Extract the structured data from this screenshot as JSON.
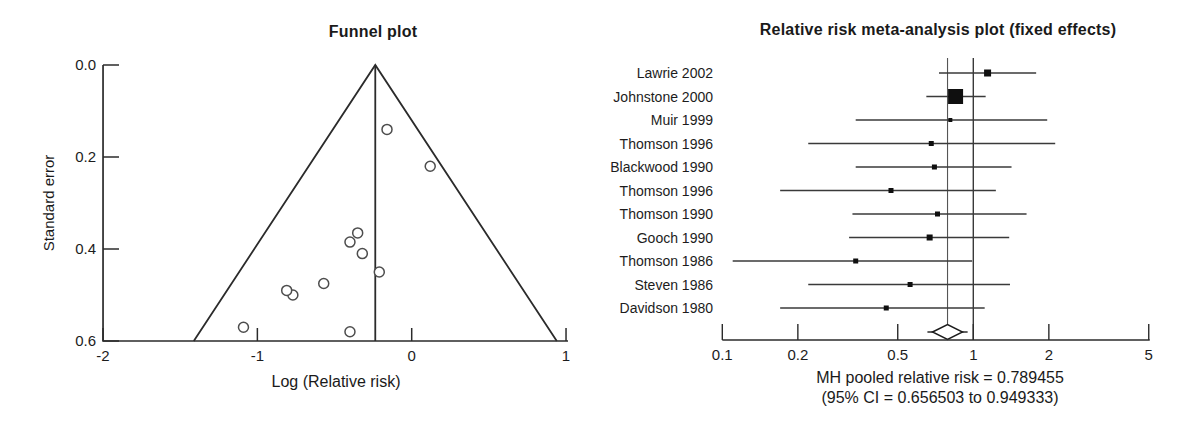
{
  "page": {
    "background": "#ffffff",
    "ink_color": "#2b2b2b"
  },
  "chart_data": [
    {
      "id": "funnel-plot",
      "type": "scatter",
      "title": "Funnel plot",
      "xlabel": "Log (Relative risk)",
      "ylabel": "Standard error",
      "xlim": [
        -2,
        1
      ],
      "ylim": [
        0,
        0.6
      ],
      "y_axis_inverted": true,
      "grid": false,
      "x_ticks": [
        {
          "value": -2,
          "label": "-2"
        },
        {
          "value": -1,
          "label": "-1"
        },
        {
          "value": 0,
          "label": "0"
        },
        {
          "value": 1,
          "label": "1"
        }
      ],
      "y_ticks": [
        {
          "value": 0,
          "label": "0.0"
        },
        {
          "value": 0.2,
          "label": "0.2"
        },
        {
          "value": 0.4,
          "label": "0.4"
        },
        {
          "value": 0.6,
          "label": "0.6"
        }
      ],
      "center_line_x": -0.236,
      "funnel_outline": {
        "apex": [
          -0.236,
          0
        ],
        "base_left": [
          -1.412,
          0.6
        ],
        "base_right": [
          0.94,
          0.6
        ]
      },
      "points": [
        {
          "study": "Lawrie 2002",
          "x": 0.12,
          "y": 0.22
        },
        {
          "study": "Johnstone 2000",
          "x": -0.16,
          "y": 0.14
        },
        {
          "study": "Muir 1999",
          "x": -0.21,
          "y": 0.45
        },
        {
          "study": "Thomson 1996",
          "x": -0.4,
          "y": 0.58
        },
        {
          "study": "Blackwood 1990",
          "x": -0.35,
          "y": 0.365
        },
        {
          "study": "Thomson 1996",
          "x": -0.77,
          "y": 0.5
        },
        {
          "study": "Thomson 1990",
          "x": -0.32,
          "y": 0.41
        },
        {
          "study": "Gooch 1990",
          "x": -0.4,
          "y": 0.385
        },
        {
          "study": "Thomson 1986",
          "x": -1.09,
          "y": 0.57
        },
        {
          "study": "Steven 1986",
          "x": -0.57,
          "y": 0.475
        },
        {
          "study": "Davidson 1980",
          "x": -0.81,
          "y": 0.49
        }
      ]
    },
    {
      "id": "forest-plot",
      "type": "scatter",
      "variant": "forest",
      "title": "Relative risk meta-analysis plot (fixed effects)",
      "x_scale": "log",
      "xlim": [
        0.1,
        5
      ],
      "grid": false,
      "x_ticks": [
        {
          "value": 0.1,
          "label": "0.1"
        },
        {
          "value": 0.2,
          "label": "0.2"
        },
        {
          "value": 0.5,
          "label": "0.5"
        },
        {
          "value": 1,
          "label": "1"
        },
        {
          "value": 2,
          "label": "2"
        },
        {
          "value": 5,
          "label": "5"
        }
      ],
      "reference_line_x": 1,
      "studies": [
        {
          "label": "Lawrie 2002",
          "rr": 1.14,
          "ci_low": 0.73,
          "ci_high": 1.78,
          "marker_px": 7
        },
        {
          "label": "Johnstone 2000",
          "rr": 0.85,
          "ci_low": 0.65,
          "ci_high": 1.12,
          "marker_px": 15
        },
        {
          "label": "Muir 1999",
          "rr": 0.81,
          "ci_low": 0.34,
          "ci_high": 1.97,
          "marker_px": 4
        },
        {
          "label": "Thomson 1996",
          "rr": 0.68,
          "ci_low": 0.22,
          "ci_high": 2.12,
          "marker_px": 5
        },
        {
          "label": "Blackwood 1990",
          "rr": 0.7,
          "ci_low": 0.34,
          "ci_high": 1.42,
          "marker_px": 5
        },
        {
          "label": "Thomson 1996",
          "rr": 0.47,
          "ci_low": 0.17,
          "ci_high": 1.23,
          "marker_px": 5
        },
        {
          "label": "Thomson 1990",
          "rr": 0.72,
          "ci_low": 0.33,
          "ci_high": 1.63,
          "marker_px": 5
        },
        {
          "label": "Gooch 1990",
          "rr": 0.67,
          "ci_low": 0.32,
          "ci_high": 1.39,
          "marker_px": 6
        },
        {
          "label": "Thomson 1986",
          "rr": 0.34,
          "ci_low": 0.11,
          "ci_high": 0.99,
          "marker_px": 5
        },
        {
          "label": "Steven 1986",
          "rr": 0.56,
          "ci_low": 0.22,
          "ci_high": 1.4,
          "marker_px": 5
        },
        {
          "label": "Davidson 1980",
          "rr": 0.45,
          "ci_low": 0.17,
          "ci_high": 1.11,
          "marker_px": 5
        }
      ],
      "pooled": {
        "method": "MH",
        "estimate": 0.789455,
        "ci_low": 0.656503,
        "ci_high": 0.949333,
        "caption_line1": "MH pooled relative risk = 0.789455",
        "caption_line2": "(95% CI = 0.656503 to 0.949333)"
      }
    }
  ]
}
